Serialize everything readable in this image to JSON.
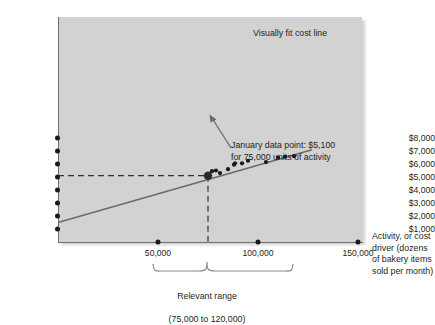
{
  "chart_data": {
    "type": "scatter",
    "title": "",
    "xlabel": "Activity, or cost driver (dozens of bakery items sold per month)",
    "ylabel": "",
    "xlim": [
      0,
      160000
    ],
    "ylim": [
      0,
      8600
    ],
    "grid": false,
    "legend": "none",
    "x_ticks": [
      {
        "value": 50000,
        "label": "50,000"
      },
      {
        "value": 100000,
        "label": "100,000"
      },
      {
        "value": 150000,
        "label": "150,000"
      }
    ],
    "y_ticks": [
      {
        "value": 1000,
        "label": "$1,000"
      },
      {
        "value": 2000,
        "label": "$2,000"
      },
      {
        "value": 3000,
        "label": "$3,000"
      },
      {
        "value": 4000,
        "label": "$4,000"
      },
      {
        "value": 5000,
        "label": "$5,000"
      },
      {
        "value": 6000,
        "label": "$6,000"
      },
      {
        "value": 7000,
        "label": "$7,000"
      },
      {
        "value": 8000,
        "label": "$8,000"
      }
    ],
    "series": [
      {
        "name": "Monthly cost observations",
        "points": [
          {
            "x": 75000,
            "y": 5100
          },
          {
            "x": 77000,
            "y": 5450
          },
          {
            "x": 79000,
            "y": 5500
          },
          {
            "x": 81000,
            "y": 5300
          },
          {
            "x": 85000,
            "y": 5600
          },
          {
            "x": 88000,
            "y": 5950
          },
          {
            "x": 88500,
            "y": 6050
          },
          {
            "x": 92000,
            "y": 6050
          },
          {
            "x": 95000,
            "y": 6250
          },
          {
            "x": 104000,
            "y": 6150
          },
          {
            "x": 110000,
            "y": 6500
          },
          {
            "x": 113500,
            "y": 6560
          },
          {
            "x": 118000,
            "y": 6600
          }
        ]
      }
    ],
    "fit_line": {
      "name": "Visually fit cost line",
      "label": "Visually fit cost line",
      "x_start": 0,
      "y_start": 1500,
      "x_end": 127000,
      "y_end": 7100
    },
    "highlight_point": {
      "x": 75000,
      "y": 5100,
      "annotation": "January data point: $5,100\nfor 75,000 units of activity"
    },
    "guide_lines": {
      "horizontal_value": 5100,
      "vertical_value": 75000,
      "style": "dashed"
    },
    "relevant_range": {
      "label": "Relevant range",
      "detail": "(75,000 to 120,000)",
      "from": 75000,
      "to": 120000
    },
    "colors": {
      "plot_background": "#d2d2d2",
      "axis": "#6e6e6e",
      "line": "#6e6e6e",
      "point": "#1a1a1a",
      "text": "#231f20"
    }
  }
}
